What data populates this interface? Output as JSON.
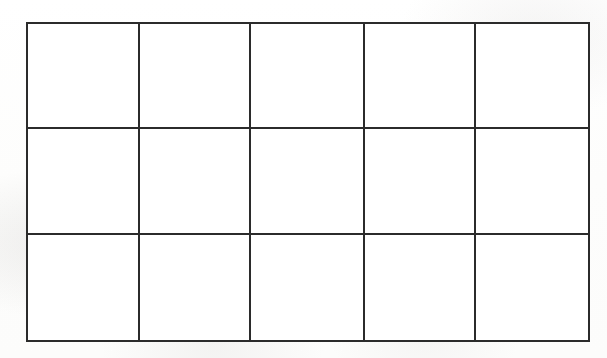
{
  "document": {
    "type": "blank-grid-table",
    "description": "Scanned blank grid table with 5 columns and 3 rows, drawn as a plain black-outlined rectangle subdivided by straight rules.",
    "background_color": "#fefefe",
    "line_color": "#2b2b2b",
    "cell_fill_color": "#ffffff"
  },
  "grid": {
    "columns": 5,
    "rows": 3,
    "outer_border_px": 2,
    "inner_border_px": 2,
    "bounds": {
      "left": 26,
      "top": 22,
      "right": 578,
      "bottom": 340
    },
    "column_dividers_x": [
      136,
      245,
      357,
      466
    ],
    "row_dividers_y": [
      127,
      233
    ],
    "column_widths": [
      110,
      109,
      112,
      109,
      112
    ],
    "row_heights": [
      105,
      106,
      107
    ],
    "cells": [
      [
        {
          "id": "r1c1",
          "text": ""
        },
        {
          "id": "r1c2",
          "text": ""
        },
        {
          "id": "r1c3",
          "text": ""
        },
        {
          "id": "r1c4",
          "text": ""
        },
        {
          "id": "r1c5",
          "text": ""
        }
      ],
      [
        {
          "id": "r2c1",
          "text": ""
        },
        {
          "id": "r2c2",
          "text": ""
        },
        {
          "id": "r2c3",
          "text": ""
        },
        {
          "id": "r2c4",
          "text": ""
        },
        {
          "id": "r2c5",
          "text": ""
        }
      ],
      [
        {
          "id": "r3c1",
          "text": ""
        },
        {
          "id": "r3c2",
          "text": ""
        },
        {
          "id": "r3c3",
          "text": ""
        },
        {
          "id": "r3c4",
          "text": ""
        },
        {
          "id": "r3c5",
          "text": ""
        }
      ]
    ]
  },
  "chart_data": {
    "type": "table",
    "title": "",
    "xlabel": "",
    "ylabel": "",
    "columns": [
      "",
      "",
      "",
      "",
      ""
    ],
    "rows": [
      [
        "",
        "",
        "",
        "",
        ""
      ],
      [
        "",
        "",
        "",
        "",
        ""
      ],
      [
        "",
        "",
        "",
        "",
        ""
      ]
    ],
    "grid": true,
    "legend": null,
    "annotations": []
  }
}
